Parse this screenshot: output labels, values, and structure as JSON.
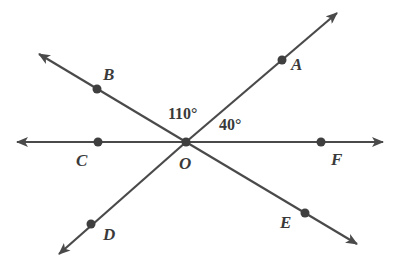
{
  "diagram": {
    "type": "intersecting-lines",
    "center_point": "O",
    "line_color": "#4a4a4a",
    "points": {
      "A": "A",
      "B": "B",
      "C": "C",
      "D": "D",
      "E": "E",
      "F": "F",
      "O": "O"
    },
    "lines": [
      {
        "name": "line-CF",
        "through": [
          "C",
          "O",
          "F"
        ]
      },
      {
        "name": "line-DA",
        "through": [
          "D",
          "O",
          "A"
        ]
      },
      {
        "name": "line-BE",
        "through": [
          "B",
          "O",
          "E"
        ]
      }
    ],
    "angles": {
      "BOA": "110°",
      "AOF": "40°"
    }
  }
}
